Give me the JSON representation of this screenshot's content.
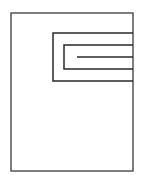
{
  "diagram": {
    "stroke_color": "#3a3a3a",
    "background": "#ffffff",
    "outer_frame": {
      "x1": 11,
      "y1": 13,
      "x2": 133,
      "y2": 171
    },
    "outer_u": {
      "left": 53,
      "top": 33,
      "bottom": 81,
      "right": 133
    },
    "inner_u": {
      "left": 64,
      "top": 45,
      "bottom": 69,
      "right": 133
    },
    "center_line": {
      "x1": 77,
      "y": 57,
      "x2": 133
    }
  }
}
